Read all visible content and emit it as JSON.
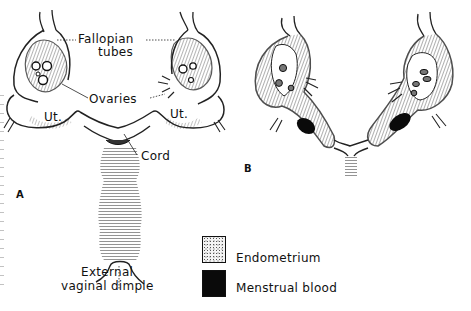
{
  "figure": {
    "panels": [
      {
        "id": "A",
        "letter": "A",
        "labels": {
          "fallopian_line1": "Fallopian",
          "fallopian_line2": "tubes",
          "ovaries": "Ovaries",
          "uterus_left": "Ut.",
          "uterus_right": "Ut.",
          "cord": "Cord",
          "dimple_line1": "External",
          "dimple_line2": "vaginal dimple"
        }
      },
      {
        "id": "B",
        "letter": "B"
      }
    ],
    "legend": {
      "items": [
        {
          "label": "Endometrium",
          "pattern": "stippled"
        },
        {
          "label": "Menstrual blood",
          "pattern": "solid-black",
          "color": "#0a0a0a"
        }
      ]
    }
  }
}
